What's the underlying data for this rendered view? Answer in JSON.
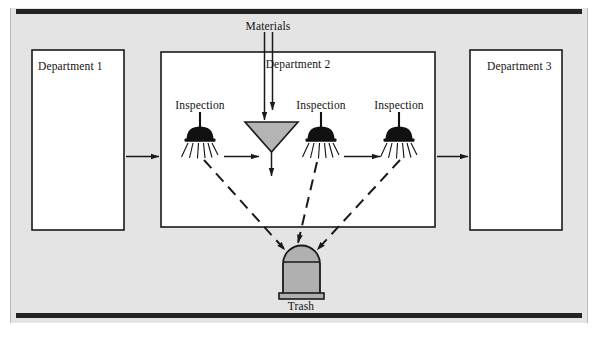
{
  "figure": {
    "type": "process-flow-diagram",
    "title_text": "",
    "background_color": "#e3e3e3",
    "page_color": "#ffffff",
    "line_color": "#1a1a1a",
    "fill_box_color": "#ffffff",
    "funnel_fill_color": "#b4b4b4",
    "trash_fill_color": "#b0b0b0",
    "inspection_head_color": "#111111"
  },
  "departments": [
    {
      "id": "dept1",
      "label": "Department 1"
    },
    {
      "id": "dept2",
      "label": "Department 2"
    },
    {
      "id": "dept3",
      "label": "Department 3"
    }
  ],
  "nodes": {
    "materials": {
      "label": "Materials"
    },
    "trash": {
      "label": "Trash"
    },
    "funnel": {
      "label": ""
    }
  },
  "inspections": [
    {
      "id": "inspection-1",
      "label": "Inspection"
    },
    {
      "id": "inspection-2",
      "label": "Inspection"
    },
    {
      "id": "inspection-3",
      "label": "Inspection"
    }
  ],
  "flows": {
    "solid_arrow_count": 6,
    "dashed_arrow_count": 3,
    "dashed_target": "Trash",
    "materials_arrow_count": 2
  }
}
